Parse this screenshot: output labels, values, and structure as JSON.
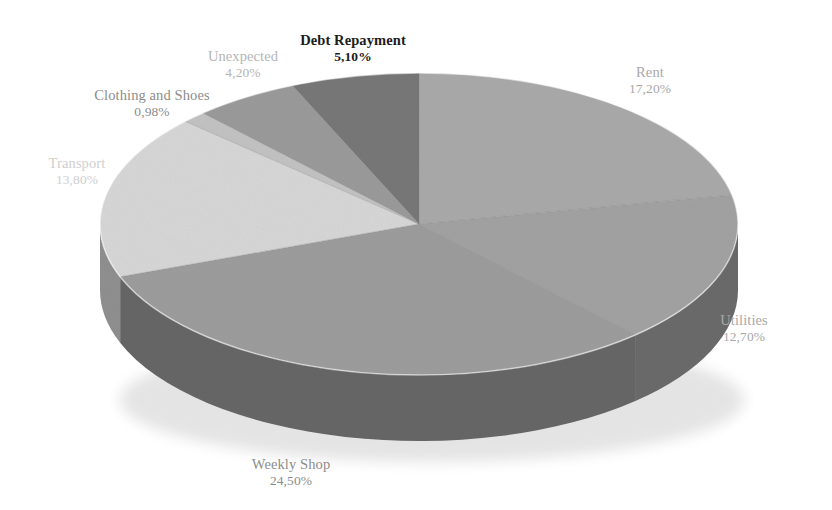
{
  "chart_data": {
    "type": "pie",
    "title": "",
    "subtitle": "",
    "xlabel": "",
    "ylabel": "",
    "legend_position": "none",
    "grid": false,
    "three_d": true,
    "value_suffix": "%",
    "decimal_separator": ",",
    "categories": [
      "Rent",
      "Utilities",
      "Weekly Shop",
      "Transport",
      "Clothing and Shoes",
      "Unexpected",
      "Debt Repayment"
    ],
    "values": [
      17.2,
      12.7,
      24.5,
      13.8,
      0.98,
      4.2,
      5.1
    ],
    "slices": [
      {
        "label": "Rent",
        "value_text": "17,20%",
        "value": 17.2,
        "color": "#a9a9a9",
        "side_color": "#6f6f6f",
        "label_style": "soft",
        "label_x": 650,
        "label_y": 64
      },
      {
        "label": "Utilities",
        "value_text": "12,70%",
        "value": 12.7,
        "color": "#a2a2a2",
        "side_color": "#6a6a6a",
        "label_style": "soft",
        "label_x": 744,
        "label_y": 312
      },
      {
        "label": "Weekly Shop",
        "value_text": "24,50%",
        "value": 24.5,
        "color": "#9c9c9c",
        "side_color": "#666666",
        "label_style": "mid",
        "label_x": 291,
        "label_y": 456
      },
      {
        "label": "Transport",
        "value_text": "13,80%",
        "value": 13.8,
        "color": "#d6d6d6",
        "side_color": "#8f8f8f",
        "label_style": "faint",
        "label_x": 77,
        "label_y": 155
      },
      {
        "label": "Clothing and Shoes",
        "value_text": "0,98%",
        "value": 0.98,
        "color": "#c2c2c2",
        "side_color": "#828282",
        "label_style": "mid",
        "label_x": 152,
        "label_y": 87
      },
      {
        "label": "Unexpected",
        "value_text": "4,20%",
        "value": 4.2,
        "color": "#9a9a9a",
        "side_color": "#646464",
        "label_style": "softer",
        "label_x": 243,
        "label_y": 48
      },
      {
        "label": "Debt Repayment",
        "value_text": "5,10%",
        "value": 5.1,
        "color": "#777777",
        "side_color": "#4e4e4e",
        "label_style": "emph",
        "label_x": 353,
        "label_y": 32
      }
    ],
    "geometry": {
      "center_x": 419,
      "center_y": 224,
      "radius_x": 319,
      "radius_y": 151,
      "depth": 66
    },
    "background_color": "#ffffff"
  }
}
